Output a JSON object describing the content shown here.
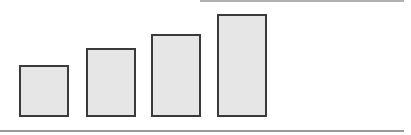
{
  "diagram": {
    "fill_color": "#e6e6e6",
    "stroke_color": "#3a3a3a",
    "rule_color": "#9a9a9a",
    "bars": [
      {
        "index": 1,
        "left": 19,
        "top": 65,
        "width": 50,
        "height": 52
      },
      {
        "index": 2,
        "left": 86,
        "top": 48,
        "width": 50,
        "height": 69
      },
      {
        "index": 3,
        "left": 151,
        "top": 34,
        "width": 50,
        "height": 83
      },
      {
        "index": 4,
        "left": 217,
        "top": 14,
        "width": 50,
        "height": 103
      }
    ],
    "top_rule": {
      "left": 200,
      "top": 0,
      "width": 204
    },
    "bottom_rule": {
      "left": 0,
      "top": 130,
      "width": 404
    }
  }
}
